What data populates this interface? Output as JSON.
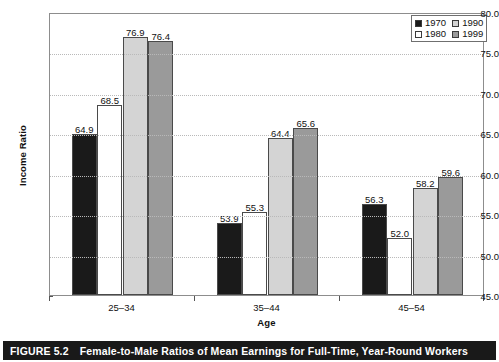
{
  "chart_data": {
    "type": "bar",
    "title": "Female-to-Male Ratios of Mean Earnings for Full-Time, Year-Round Workers",
    "xlabel": "Age",
    "ylabel": "Income Ratio",
    "categories": [
      "25–34",
      "35–44",
      "45–54"
    ],
    "series": [
      {
        "name": "1970",
        "values": [
          64.9,
          53.9,
          56.3
        ],
        "color": "#1a1a1a"
      },
      {
        "name": "1980",
        "values": [
          68.5,
          55.3,
          52.0
        ],
        "color": "#ffffff"
      },
      {
        "name": "1990",
        "values": [
          76.9,
          64.4,
          58.2
        ],
        "color": "#d4d4d4"
      },
      {
        "name": "1999",
        "values": [
          76.4,
          65.6,
          59.6
        ],
        "color": "#9a9a9a"
      }
    ],
    "ylim": [
      45.0,
      80.0
    ],
    "yticks": [
      "45.0",
      "50.0",
      "55.0",
      "60.0",
      "65.0",
      "70.0",
      "75.0",
      "80.0"
    ],
    "ytick_values": [
      45.0,
      50.0,
      55.0,
      60.0,
      65.0,
      70.0,
      75.0,
      80.0
    ],
    "grid": true,
    "legend_position": "top-right",
    "legend_order": [
      "1970",
      "1990",
      "1980",
      "1999"
    ]
  },
  "caption": {
    "number": "FIGURE 5.2",
    "text": "Female-to-Male Ratios of Mean Earnings for Full-Time, Year-Round Workers"
  }
}
